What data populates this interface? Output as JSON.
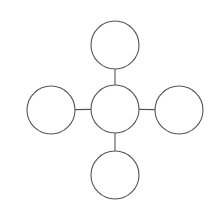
{
  "diagram": {
    "type": "hub-and-spoke",
    "width": 221,
    "height": 215,
    "stroke_color": "#555555",
    "fill_color": "#ffffff",
    "background": "#ffffff",
    "stroke_width": 1.1,
    "nodes": [
      {
        "id": "center",
        "cx": 115,
        "cy": 109,
        "r": 24,
        "label": ""
      },
      {
        "id": "top",
        "cx": 115,
        "cy": 45,
        "r": 24,
        "label": ""
      },
      {
        "id": "left",
        "cx": 51,
        "cy": 110,
        "r": 24,
        "label": ""
      },
      {
        "id": "right",
        "cx": 179,
        "cy": 110,
        "r": 24,
        "label": ""
      },
      {
        "id": "bottom",
        "cx": 115,
        "cy": 175,
        "r": 24,
        "label": ""
      }
    ],
    "edges": [
      {
        "from": "center",
        "to": "top"
      },
      {
        "from": "center",
        "to": "left"
      },
      {
        "from": "center",
        "to": "right"
      },
      {
        "from": "center",
        "to": "bottom"
      }
    ]
  }
}
